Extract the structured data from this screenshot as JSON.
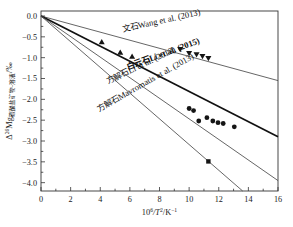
{
  "chart_data": {
    "type": "line",
    "title": "",
    "xlabel": "10⁶/T²/K⁻¹",
    "ylabel": "Δ²⁶Mg碳酸盐矿物-溶液/‰",
    "ylabel_parts": {
      "delta": "Δ",
      "superscript": "26",
      "element": "Mg",
      "subscript": "碳酸盐矿物-溶液",
      "unit": "/‰"
    },
    "xlim": [
      0,
      16
    ],
    "ylim": [
      -4.2,
      0.12
    ],
    "xticks": [
      0,
      2,
      4,
      6,
      8,
      10,
      12,
      14,
      16
    ],
    "xtick_labels": [
      "0",
      "2",
      "4",
      "6",
      "8",
      "10",
      "12",
      "14",
      "16"
    ],
    "yticks": [
      0.0,
      -0.5,
      -1.0,
      -1.5,
      -2.0,
      -2.5,
      -3.0,
      -3.5,
      -4.0
    ],
    "ytick_labels": [
      "0.0",
      "−0.5",
      "−1.0",
      "−1.5",
      "−2.0",
      "−2.5",
      "−3.0",
      "−3.5",
      "−4.0"
    ],
    "grid": false,
    "legend_position": "inline-along-lines",
    "series": [
      {
        "name": "aragonite-wang-2013",
        "label_cjk": "文石",
        "label_latin": "Wang et al. (2013)",
        "label_full": "文石Wang et al. (2013)",
        "mineral_en": "aragonite",
        "slope": -0.0969,
        "intercept": 0.0,
        "line_style": "thin",
        "marker": "triangle-down",
        "x_endpoints": [
          0,
          16
        ],
        "points": [
          {
            "x": 9.4,
            "y": -0.8
          },
          {
            "x": 10.0,
            "y": -0.9
          },
          {
            "x": 10.5,
            "y": -0.93
          },
          {
            "x": 10.9,
            "y": -0.97
          },
          {
            "x": 11.3,
            "y": -1.02
          }
        ]
      },
      {
        "name": "dolomite-li-2015",
        "label_cjk": "白云石",
        "label_latin": "Li et al. (2015)",
        "label_full": "白云石Li et al. (2015)",
        "mineral_en": "dolomite",
        "slope": -0.1813,
        "intercept": 0.0,
        "line_style": "thick",
        "marker": "triangle-up",
        "x_endpoints": [
          0,
          16
        ],
        "points": [
          {
            "x": 4.1,
            "y": -0.62
          },
          {
            "x": 5.35,
            "y": -0.87
          },
          {
            "x": 6.15,
            "y": -0.97
          }
        ]
      },
      {
        "name": "calcite-li-2012",
        "label_cjk": "方解石",
        "label_latin": "Li et al. (2012)",
        "label_full": "方解石Li et al. (2012)",
        "mineral_en": "calcite",
        "slope": -0.2469,
        "intercept": 0.0,
        "line_style": "thin",
        "marker": "circle",
        "x_endpoints": [
          0,
          16
        ],
        "points": [
          {
            "x": 10.0,
            "y": -2.22
          },
          {
            "x": 10.3,
            "y": -2.27
          },
          {
            "x": 10.65,
            "y": -2.52
          },
          {
            "x": 11.2,
            "y": -2.44
          },
          {
            "x": 11.6,
            "y": -2.52
          },
          {
            "x": 11.95,
            "y": -2.56
          },
          {
            "x": 12.3,
            "y": -2.58
          },
          {
            "x": 13.05,
            "y": -2.66
          }
        ]
      },
      {
        "name": "calcite-mavromatis-2013",
        "label_cjk": "方解石",
        "label_latin": "Mavromatis et al. (2013)",
        "label_full": "方解石Mavromatis et al. (2013)",
        "mineral_en": "calcite",
        "slope": -0.3085,
        "intercept": 0.0,
        "line_style": "thin",
        "marker": "square",
        "x_endpoints": [
          0,
          13.7
        ],
        "points": [
          {
            "x": 11.3,
            "y": -3.49
          }
        ]
      }
    ],
    "annotations": [
      {
        "name": "label-aragonite-wang-2013",
        "cjk": "文石",
        "latin": "Wang et al. (2013)",
        "x": 123,
        "y": 32,
        "rotate": -12.5,
        "bold": false
      },
      {
        "name": "label-dolomite-li-2015",
        "cjk": "白云石",
        "latin": "Li et al. (2015)",
        "x": 128,
        "y": 70,
        "rotate": -20.5,
        "bold": true
      },
      {
        "name": "label-calcite-li-2012",
        "cjk": "方解石",
        "latin": "Li et al. (2012)",
        "x": 108,
        "y": 84,
        "rotate": -25.5,
        "bold": false
      },
      {
        "name": "label-calcite-mavromatis-2013",
        "cjk": "方解石",
        "latin": "Mavromatis et al. (2013)",
        "x": 99,
        "y": 112,
        "rotate": -29.5,
        "bold": false
      }
    ]
  }
}
